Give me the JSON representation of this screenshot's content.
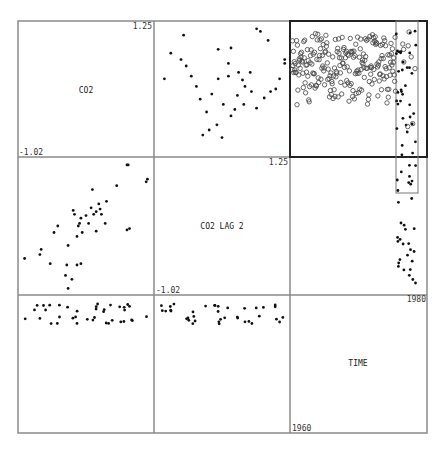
{
  "chart_data": {
    "type": "scatter",
    "layout": {
      "rows": 3,
      "cols": 3,
      "grid": false,
      "legend": "none"
    },
    "variables": [
      {
        "name": "CO2",
        "label": "CO2",
        "min_label": "-1.02",
        "max_label": "1.25",
        "range": [
          -1.02,
          1.25
        ]
      },
      {
        "name": "CO2 LAG 2",
        "label": "CO2 LAG 2",
        "min_label": "-1.02",
        "max_label": "1.25",
        "range": [
          -1.02,
          1.25
        ]
      },
      {
        "name": "TIME",
        "label": "TIME",
        "min_label": "1960",
        "max_label": "1980",
        "range": [
          1960,
          1980
        ]
      }
    ],
    "brush": {
      "panel": "row0-col2",
      "x_range_frac": [
        0.79,
        0.96
      ],
      "y_range_frac": [
        0.0,
        1.27
      ],
      "highlighted_marker": "filled",
      "other_marker": "open-circle"
    },
    "panels": [
      {
        "row": 0,
        "col": 1,
        "x": "CO2 LAG 2",
        "y": "CO2",
        "points": [
          [
            0.05,
            0.58
          ],
          [
            0.22,
            0.68
          ],
          [
            0.33,
            0.42
          ],
          [
            0.38,
            0.32
          ],
          [
            0.46,
            0.22
          ],
          [
            0.35,
            0.14
          ],
          [
            0.4,
            0.18
          ],
          [
            0.5,
            0.12
          ],
          [
            0.1,
            0.78
          ],
          [
            0.18,
            0.73
          ],
          [
            0.47,
            0.81
          ],
          [
            0.55,
            0.7
          ],
          [
            0.57,
            0.82
          ],
          [
            0.63,
            0.63
          ],
          [
            0.66,
            0.57
          ],
          [
            0.73,
            0.48
          ],
          [
            0.72,
            0.63
          ],
          [
            0.77,
            0.35
          ],
          [
            0.83,
            0.43
          ],
          [
            0.88,
            0.48
          ],
          [
            0.92,
            0.5
          ],
          [
            0.95,
            0.58
          ],
          [
            0.99,
            0.73
          ],
          [
            0.86,
            0.88
          ],
          [
            0.8,
            0.95
          ],
          [
            0.77,
            0.97
          ],
          [
            0.99,
            0.7
          ],
          [
            0.57,
            0.29
          ],
          [
            0.62,
            0.45
          ],
          [
            0.67,
            0.38
          ],
          [
            0.68,
            0.52
          ],
          [
            0.55,
            0.6
          ],
          [
            0.51,
            0.38
          ],
          [
            0.42,
            0.46
          ],
          [
            0.3,
            0.52
          ],
          [
            0.26,
            0.6
          ],
          [
            0.47,
            0.58
          ],
          [
            0.2,
            0.92
          ],
          [
            0.6,
            0.34
          ]
        ]
      },
      {
        "row": 1,
        "col": 0,
        "x": "CO2",
        "y": "CO2 LAG 2",
        "points": [
          [
            0.02,
            0.25
          ],
          [
            0.14,
            0.28
          ],
          [
            0.15,
            0.32
          ],
          [
            0.22,
            0.21
          ],
          [
            0.25,
            0.45
          ],
          [
            0.28,
            0.5
          ],
          [
            0.34,
            0.12
          ],
          [
            0.35,
            0.2
          ],
          [
            0.36,
            0.35
          ],
          [
            0.4,
            0.62
          ],
          [
            0.41,
            0.59
          ],
          [
            0.43,
            0.42
          ],
          [
            0.44,
            0.5
          ],
          [
            0.45,
            0.52
          ],
          [
            0.46,
            0.56
          ],
          [
            0.47,
            0.45
          ],
          [
            0.46,
            0.21
          ],
          [
            0.5,
            0.58
          ],
          [
            0.52,
            0.52
          ],
          [
            0.54,
            0.64
          ],
          [
            0.55,
            0.78
          ],
          [
            0.56,
            0.59
          ],
          [
            0.58,
            0.61
          ],
          [
            0.58,
            0.46
          ],
          [
            0.6,
            0.67
          ],
          [
            0.61,
            0.63
          ],
          [
            0.62,
            0.59
          ],
          [
            0.65,
            0.52
          ],
          [
            0.66,
            0.69
          ],
          [
            0.74,
            0.81
          ],
          [
            0.82,
            0.47
          ],
          [
            0.84,
            0.48
          ],
          [
            0.82,
            0.97
          ],
          [
            0.83,
            0.97
          ],
          [
            0.97,
            0.84
          ],
          [
            0.98,
            0.86
          ],
          [
            0.36,
            0.02
          ],
          [
            0.43,
            0.2
          ],
          [
            0.39,
            0.09
          ]
        ]
      },
      {
        "row": 0,
        "col": 2,
        "x": "TIME",
        "y": "CO2",
        "note": "monthly series, brushed region filled",
        "n_points_approx": 250
      },
      {
        "row": 1,
        "col": 2,
        "x": "TIME",
        "y": "CO2 LAG 2",
        "note": "only brushed points shown (filled), x≈0.79–0.96",
        "n_points_approx": 35
      },
      {
        "row": 2,
        "col": 0,
        "x": "CO2",
        "y": "TIME",
        "note": "points in two bands near top of panel",
        "n_points_approx": 40
      },
      {
        "row": 2,
        "col": 1,
        "x": "CO2 LAG 2",
        "y": "TIME",
        "note": "points in two bands near top of panel",
        "n_points_approx": 40
      }
    ]
  },
  "diagonal": {
    "co2": {
      "label": "CO2",
      "max": "1.25",
      "min": "-1.02"
    },
    "co2lag": {
      "label": "CO2 LAG 2",
      "max": "1.25",
      "min": "-1.02"
    },
    "time": {
      "label": "TIME",
      "max": "1980",
      "min": "1960"
    }
  }
}
